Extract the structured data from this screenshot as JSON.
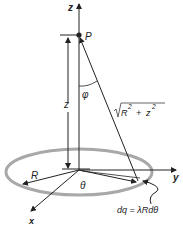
{
  "figure": {
    "colors": {
      "lines": "#222222",
      "ring": "#a8a8a8",
      "background": "#ffffff"
    },
    "labels": {
      "z_axis": "z",
      "y_axis": "y",
      "x_axis": "x",
      "point": "P",
      "height": "z",
      "angle_phi": "φ",
      "angle_theta": "θ",
      "radius": "R",
      "distance_radical": "√",
      "distance_R": "R",
      "distance_exp1": "2",
      "distance_plus": "+",
      "distance_z": "z",
      "distance_exp2": "2",
      "charge_element": "dq = λRdθ"
    }
  }
}
